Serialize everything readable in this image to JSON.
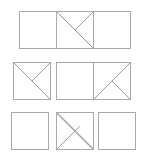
{
  "figure": {
    "canvas": {
      "width": 149,
      "height": 162,
      "background": "#ffffff"
    },
    "stroke_color": "#9a9a9a",
    "border_color": "#a9a9a9",
    "rows": [
      {
        "name": "row-1",
        "y": 11,
        "cells": [
          {
            "name": "row1-cell1",
            "x": 19,
            "size": 38,
            "lines": []
          },
          {
            "name": "row1-cell2",
            "x": 56,
            "size": 38,
            "lines": [
              {
                "name": "main-diagonal",
                "x1": 0,
                "y1": 0,
                "x2": 38,
                "y2": 38,
                "thick": false
              },
              {
                "name": "anti-diagonal-half",
                "x1": 38,
                "y1": 0,
                "x2": 19,
                "y2": 19,
                "thick": false
              }
            ]
          },
          {
            "name": "row1-cell3",
            "x": 93,
            "size": 38,
            "lines": []
          }
        ]
      },
      {
        "name": "row-2",
        "y": 62,
        "cells": [
          {
            "name": "row2-cell1",
            "x": 13,
            "size": 38,
            "lines": [
              {
                "name": "main-diagonal",
                "x1": 0,
                "y1": 0,
                "x2": 38,
                "y2": 38,
                "thick": false
              },
              {
                "name": "anti-diagonal-half",
                "x1": 38,
                "y1": 0,
                "x2": 19,
                "y2": 19,
                "thick": false
              }
            ]
          },
          {
            "name": "row2-cell2",
            "x": 56,
            "size": 38,
            "lines": []
          },
          {
            "name": "row2-cell3",
            "x": 93,
            "size": 38,
            "lines": [
              {
                "name": "anti-diagonal",
                "x1": 38,
                "y1": 0,
                "x2": 0,
                "y2": 38,
                "thick": false
              },
              {
                "name": "main-diagonal-half",
                "x1": 38,
                "y1": 38,
                "x2": 19,
                "y2": 19,
                "thick": false
              }
            ]
          }
        ]
      },
      {
        "name": "row-3",
        "y": 112,
        "cells": [
          {
            "name": "row3-cell1",
            "x": 11,
            "size": 38,
            "lines": []
          },
          {
            "name": "row3-cell2",
            "x": 56,
            "size": 38,
            "lines": [
              {
                "name": "main-diagonal-thick",
                "x1": 0,
                "y1": 0,
                "x2": 38,
                "y2": 38,
                "thick": true
              },
              {
                "name": "anti-diagonal-half",
                "x1": 0,
                "y1": 38,
                "x2": 24,
                "y2": 14,
                "thick": false
              }
            ]
          },
          {
            "name": "row3-cell3",
            "x": 98,
            "size": 38,
            "lines": []
          }
        ]
      }
    ]
  }
}
